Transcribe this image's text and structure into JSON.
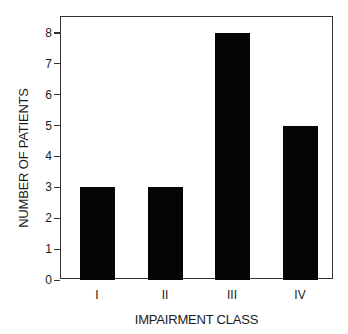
{
  "chart_data": {
    "type": "bar",
    "title": "",
    "xlabel": "IMPAIRMENT CLASS",
    "ylabel": "NUMBER OF PATIENTS",
    "categories": [
      "I",
      "II",
      "III",
      "IV"
    ],
    "values": [
      3,
      3,
      8,
      5
    ],
    "ylim": [
      0,
      8.5
    ],
    "yticks": [
      0,
      1,
      2,
      3,
      4,
      5,
      6,
      7,
      8
    ],
    "grid": false,
    "legend": null,
    "bar_color": "#050505"
  }
}
